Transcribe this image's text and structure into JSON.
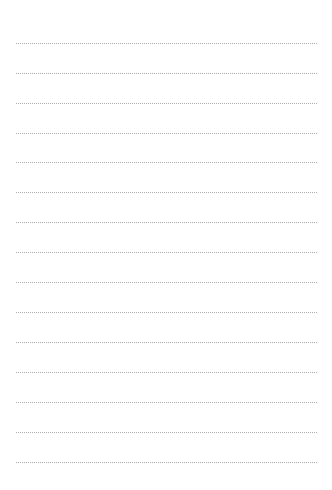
{
  "page": {
    "type": "lined-paper",
    "background_color": "#ffffff",
    "rule_color": "#9e9e9e",
    "rule_style": "dotted",
    "rule_count": 15,
    "rule_left": 16,
    "rule_width": 302,
    "rule_first_y": 43,
    "rule_spacing": 29.9
  },
  "rules": [
    {
      "y": 43
    },
    {
      "y": 73
    },
    {
      "y": 103
    },
    {
      "y": 133
    },
    {
      "y": 162
    },
    {
      "y": 192
    },
    {
      "y": 222
    },
    {
      "y": 252
    },
    {
      "y": 282
    },
    {
      "y": 312
    },
    {
      "y": 342
    },
    {
      "y": 372
    },
    {
      "y": 402
    },
    {
      "y": 432
    },
    {
      "y": 462
    }
  ]
}
